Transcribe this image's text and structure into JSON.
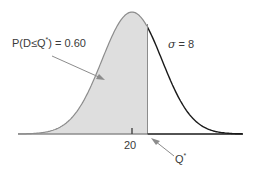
{
  "chart_data": {
    "type": "area",
    "title": "",
    "distribution": "normal",
    "mean": 20,
    "sigma": 8,
    "shaded_region": "left of Q*",
    "shaded_probability": 0.6,
    "x_tick_labels": [
      "20"
    ],
    "annotations": [
      {
        "text": "P(D≤Q*) = 0.60",
        "points_to": "shaded area"
      },
      {
        "text": "σ = 8",
        "position": "right of peak"
      },
      {
        "text": "Q*",
        "points_to": "boundary of shaded area on x-axis"
      }
    ],
    "colors": {
      "shade": "#dcdcdc",
      "curve_left": "#8a8a8a",
      "curve_right": "#1a1a1a",
      "axis": "#8a8a8a",
      "arrow": "#8a8a8a"
    }
  },
  "labels": {
    "prob_prefix": "P(D≤Q",
    "prob_star": "*",
    "prob_suffix": ") = 0.60",
    "sigma_symbol": "σ",
    "sigma_value": " = 8",
    "mean_tick": "20",
    "q_label": "Q",
    "q_star": "*"
  }
}
